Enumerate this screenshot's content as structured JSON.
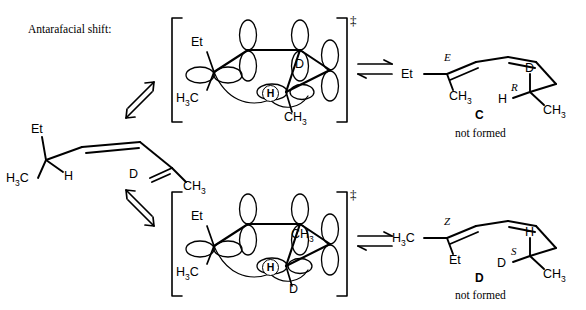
{
  "figure": {
    "title": "Antarafacial shift:",
    "type": "reaction-scheme"
  },
  "reactant": {
    "name": "starting-diene",
    "labels": {
      "ethyl": "Et",
      "methyl": "H3C",
      "hydrogen": "H",
      "deuterium": "D",
      "methyl_right": "CH3"
    }
  },
  "arrows": {
    "equilibrium_up": "equilibrium-arrows-up",
    "equilibrium_down": "equilibrium-arrows-down",
    "equilibrium_right": "equilibrium-arrows-horizontal"
  },
  "transition_state_top": {
    "name": "transition-state-top",
    "dagger": "‡",
    "labels": {
      "ethyl": "Et",
      "methyl_left": "H3C",
      "hydrogen": "H",
      "deuterium": "D",
      "methyl_right": "CH3"
    }
  },
  "transition_state_bottom": {
    "name": "transition-state-bottom",
    "dagger": "‡",
    "labels": {
      "ethyl": "Et",
      "methyl_left": "H3C",
      "hydrogen": "H",
      "methyl_right": "CH3",
      "deuterium": "D"
    }
  },
  "product_top": {
    "name": "product-C",
    "compound_label": "C",
    "status": "not formed",
    "labels": {
      "ethyl": "Et",
      "alkene_descriptor": "E",
      "methyl_left": "CH3",
      "deuterium": "D",
      "stereo_descriptor": "R",
      "hydrogen": "H",
      "methyl_right": "CH3"
    }
  },
  "product_bottom": {
    "name": "product-D",
    "compound_label": "D",
    "status": "not formed",
    "labels": {
      "methyl_left": "H3C",
      "alkene_descriptor": "Z",
      "ethyl": "Et",
      "hydrogen": "H",
      "stereo_descriptor": "S",
      "deuterium": "D",
      "methyl_right": "CH3"
    }
  },
  "colors": {
    "ink": "#000000",
    "background": "#ffffff"
  }
}
